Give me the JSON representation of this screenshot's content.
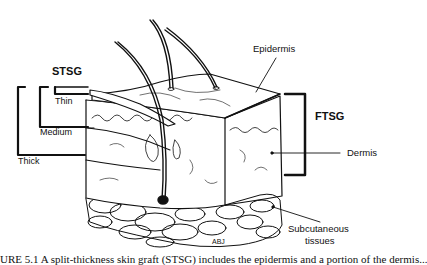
{
  "figure": {
    "labels": {
      "stsg": "STSG",
      "thin": "Thin",
      "medium": "Medium",
      "thick": "Thick",
      "epidermis": "Epidermis",
      "ftsg": "FTSG",
      "dermis": "Dermis",
      "subcutaneous_line1": "Subcutaneous",
      "subcutaneous_line2": "tissues",
      "signature": "ABJ"
    },
    "caption": "URE 5.1  A split-thickness skin graft (STSG) includes the epidermis and a portion of the dermis..."
  },
  "colors": {
    "ink": "#111111",
    "background": "#ffffff"
  }
}
